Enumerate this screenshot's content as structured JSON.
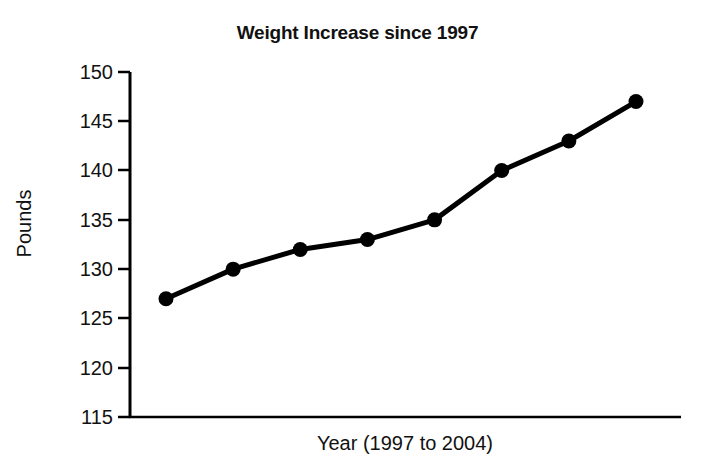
{
  "chart_data": {
    "type": "line",
    "title": "Weight Increase since 1997",
    "xlabel": "Year (1997 to 2004)",
    "ylabel": "Pounds",
    "categories": [
      "1997",
      "1998",
      "1999",
      "2000",
      "2001",
      "2002",
      "2003",
      "2004"
    ],
    "x": [
      1997,
      1998,
      1999,
      2000,
      2001,
      2002,
      2003,
      2004
    ],
    "values": [
      127,
      130,
      132,
      133,
      135,
      140,
      143,
      147
    ],
    "series": [
      {
        "name": "Weight",
        "values": [
          127,
          130,
          132,
          133,
          135,
          140,
          143,
          147
        ]
      }
    ],
    "ylim": [
      115,
      150
    ],
    "yticks": [
      150,
      145,
      140,
      135,
      130,
      125,
      120,
      115
    ],
    "ytick_labels": [
      "150",
      "145",
      "140",
      "135",
      "130",
      "125",
      "120",
      "115"
    ],
    "xtick_labels": [],
    "grid": false,
    "legend": false,
    "legend_position": "none",
    "line_color": "#000000",
    "marker": "circle",
    "marker_color": "#000000",
    "background_color": "#ffffff",
    "axis_color": "#000000"
  }
}
